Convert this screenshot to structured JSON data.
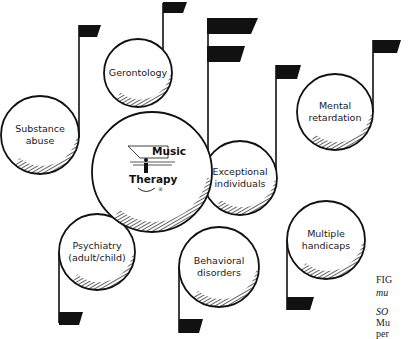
{
  "diagram": {
    "center": {
      "title_line1": "Music",
      "title_line2": "Therapy"
    },
    "nodes": [
      {
        "id": "gerontology",
        "lines": [
          "Gerontology"
        ]
      },
      {
        "id": "substance-abuse",
        "lines": [
          "Substance",
          "abuse"
        ]
      },
      {
        "id": "exceptional-individuals",
        "lines": [
          "Exceptional",
          "individuals"
        ]
      },
      {
        "id": "mental-retardation",
        "lines": [
          "Mental",
          "retardation"
        ]
      },
      {
        "id": "psychiatry",
        "lines": [
          "Psychiatry",
          "(adult/child)"
        ]
      },
      {
        "id": "behavioral-disorders",
        "lines": [
          "Behavioral",
          "disorders"
        ]
      },
      {
        "id": "multiple-handicaps",
        "lines": [
          "Multiple",
          "handicaps"
        ]
      }
    ]
  },
  "caption": {
    "fig_label": "FIG",
    "fig_title_fragment": "mu",
    "source_label": "SO",
    "source_line2": "Mu",
    "source_line3": "per"
  },
  "colors": {
    "ink": "#111111",
    "background": "#ffffff"
  }
}
